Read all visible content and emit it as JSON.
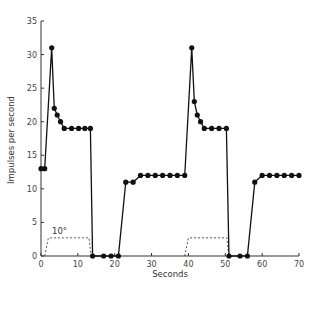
{
  "chart_data": {
    "type": "line",
    "title": "",
    "xlabel": "Seconds",
    "ylabel": "Impulses per second",
    "xlim": [
      0,
      70
    ],
    "ylim": [
      0,
      35
    ],
    "xticks": [
      0,
      10,
      20,
      30,
      40,
      50,
      60,
      70
    ],
    "yticks": [
      0,
      5,
      10,
      15,
      20,
      25,
      30,
      35
    ],
    "grid": false,
    "legend": null,
    "series": [
      {
        "name": "Impulse frequency",
        "style": "solid line with filled circle markers",
        "color": "#111111",
        "points": [
          [
            0,
            13
          ],
          [
            1,
            13
          ],
          [
            2.9,
            31
          ],
          [
            3.6,
            22
          ],
          [
            4.4,
            21
          ],
          [
            5.3,
            20
          ],
          [
            6.3,
            19
          ],
          [
            8.3,
            19
          ],
          [
            10.2,
            19
          ],
          [
            11.9,
            19
          ],
          [
            13.4,
            19
          ],
          [
            14,
            0
          ],
          [
            17,
            0
          ],
          [
            19,
            0
          ],
          [
            21,
            0
          ],
          [
            23,
            11
          ],
          [
            25,
            11
          ],
          [
            27,
            12
          ],
          [
            29,
            12
          ],
          [
            31,
            12
          ],
          [
            33,
            12
          ],
          [
            35,
            12
          ],
          [
            37,
            12
          ],
          [
            39,
            12
          ],
          [
            40.9,
            31
          ],
          [
            41.6,
            23
          ],
          [
            42.4,
            21
          ],
          [
            43.3,
            20
          ],
          [
            44.3,
            19
          ],
          [
            46.3,
            19
          ],
          [
            48.3,
            19
          ],
          [
            50.3,
            19
          ],
          [
            51,
            0
          ],
          [
            54,
            0
          ],
          [
            56,
            0
          ],
          [
            58,
            11
          ],
          [
            60,
            12
          ],
          [
            62,
            12
          ],
          [
            64,
            12
          ],
          [
            66,
            12
          ],
          [
            68,
            12
          ],
          [
            70,
            12
          ]
        ]
      },
      {
        "name": "Stimulus (10°)",
        "style": "dashed line",
        "color": "#555555",
        "points": [
          [
            1,
            0
          ],
          [
            2,
            2.7
          ],
          [
            13,
            2.7
          ],
          [
            13.6,
            0
          ],
          [
            39,
            0
          ],
          [
            40,
            2.7
          ],
          [
            50.4,
            2.7
          ],
          [
            51,
            0
          ]
        ],
        "segments": [
          [
            [
              1,
              0
            ],
            [
              2,
              2.7
            ],
            [
              13,
              2.7
            ],
            [
              13.6,
              0
            ]
          ],
          [
            [
              39,
              0
            ],
            [
              40,
              2.7
            ],
            [
              50.4,
              2.7
            ],
            [
              51,
              0
            ]
          ]
        ]
      }
    ],
    "annotations": [
      {
        "text": "10°",
        "x": 3,
        "y": 3.3
      }
    ]
  },
  "labels": {
    "xlabel": "Seconds",
    "ylabel": "Impulses per second",
    "stimulus_annotation": "10°"
  }
}
